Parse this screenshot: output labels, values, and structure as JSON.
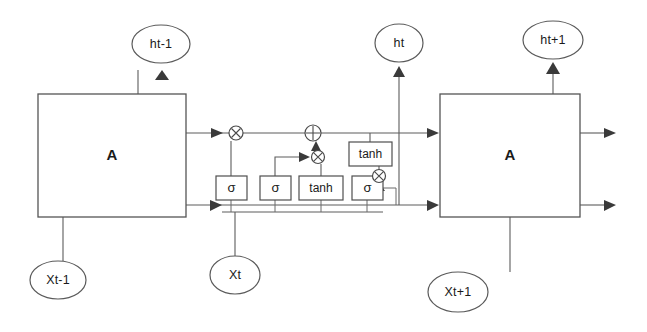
{
  "diagram": {
    "colors": {
      "background": "#ffffff",
      "wire": "#5c5c5c",
      "outline": "#4f4f4f",
      "text": "#1a1a1a",
      "arrow": "#3a3a3a"
    },
    "cells": [
      {
        "id": "cell-prev",
        "label": "A",
        "x": 38,
        "y": 94,
        "w": 148,
        "h": 123
      },
      {
        "id": "cell-next",
        "label": "A",
        "x": 440,
        "y": 94,
        "w": 140,
        "h": 123
      }
    ],
    "hidden_outputs": [
      {
        "id": "h-prev",
        "label": "ht-1",
        "cx": 161,
        "cy": 44,
        "rx": 29,
        "ry": 19
      },
      {
        "id": "h-curr",
        "label": "ht",
        "cx": 399,
        "cy": 43,
        "rx": 24,
        "ry": 19
      },
      {
        "id": "h-next",
        "label": "ht+1",
        "cx": 553,
        "cy": 40,
        "rx": 30,
        "ry": 19
      }
    ],
    "inputs": [
      {
        "id": "x-prev",
        "label": "Xt-1",
        "cx": 58,
        "cy": 280,
        "rx": 28,
        "ry": 19
      },
      {
        "id": "x-curr",
        "label": "Xt",
        "cx": 235,
        "cy": 275,
        "rx": 25,
        "ry": 19
      },
      {
        "id": "x-next",
        "label": "Xt+1",
        "cx": 458,
        "cy": 292,
        "rx": 30,
        "ry": 20
      }
    ],
    "gates": [
      {
        "id": "gate-forget",
        "label": "σ",
        "kind": "sigma",
        "x": 216,
        "y": 176,
        "w": 31,
        "h": 24
      },
      {
        "id": "gate-input",
        "label": "σ",
        "kind": "sigma",
        "x": 260,
        "y": 176,
        "w": 31,
        "h": 24
      },
      {
        "id": "gate-candidate",
        "label": "tanh",
        "kind": "tanh",
        "x": 299,
        "y": 176,
        "w": 44,
        "h": 24
      },
      {
        "id": "gate-output",
        "label": "σ",
        "kind": "sigma",
        "x": 352,
        "y": 176,
        "w": 31,
        "h": 24
      },
      {
        "id": "gate-cell-tanh",
        "label": "tanh",
        "kind": "tanh",
        "x": 349,
        "y": 142,
        "w": 43,
        "h": 24
      }
    ],
    "operators": [
      {
        "id": "op-forget-multiply",
        "symbol": "⊗",
        "name": "multiply",
        "cx": 236,
        "cy": 133,
        "r": 7
      },
      {
        "id": "op-cell-add",
        "symbol": "⊕",
        "name": "add",
        "cx": 313,
        "cy": 133,
        "r": 8
      },
      {
        "id": "op-input-multiply",
        "symbol": "⊗",
        "name": "multiply",
        "cx": 318,
        "cy": 157,
        "r": 6.5
      },
      {
        "id": "op-output-multiply",
        "symbol": "⊗",
        "name": "multiply",
        "cx": 379,
        "cy": 176,
        "r": 6.5
      }
    ],
    "lines": {
      "cell_state_y": 133,
      "hidden_state_y": 205,
      "ht_vertical_x": 399
    }
  }
}
